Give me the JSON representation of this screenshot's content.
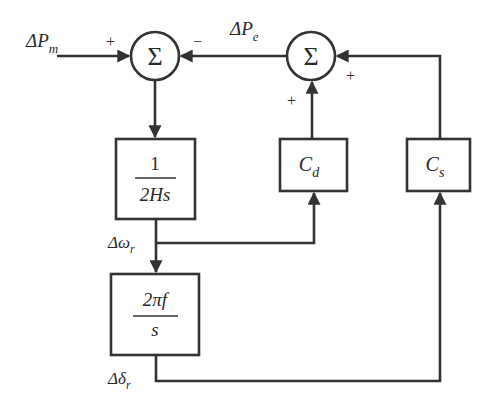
{
  "diagram": {
    "type": "block-diagram",
    "title": "",
    "colors": {
      "line": "#333333",
      "text": "#2a2a2a",
      "background": "#ffffff"
    },
    "nodes": [
      {
        "id": "sum1",
        "kind": "summing-junction",
        "symbol": "Σ"
      },
      {
        "id": "sum2",
        "kind": "summing-junction",
        "symbol": "Σ"
      },
      {
        "id": "inertia",
        "kind": "block",
        "numerator": "1",
        "denominator": "2Hs"
      },
      {
        "id": "integrator",
        "kind": "block",
        "numerator": "2πf",
        "denominator": "s"
      },
      {
        "id": "damping",
        "kind": "block",
        "label": "C",
        "subscript": "d"
      },
      {
        "id": "synchronizing",
        "kind": "block",
        "label": "C",
        "subscript": "s"
      }
    ],
    "signals": {
      "input": {
        "base": "ΔP",
        "sub": "m"
      },
      "electrical": {
        "base": "ΔP",
        "sub": "e"
      },
      "speed": {
        "base": "Δω",
        "sub": "r"
      },
      "angle": {
        "base": "Δδ",
        "sub": "r"
      }
    },
    "signs": {
      "sum1_input": "+",
      "sum1_feedback": "−",
      "sum2_from_damping": "+",
      "sum2_from_sync": "+"
    },
    "edges": [
      {
        "from": "input",
        "to": "sum1",
        "sign": "+"
      },
      {
        "from": "sum2",
        "to": "sum1",
        "sign": "−",
        "label": "ΔPe"
      },
      {
        "from": "sum1",
        "to": "inertia"
      },
      {
        "from": "inertia",
        "to": "integrator",
        "label": "Δωr"
      },
      {
        "from": "inertia",
        "to": "damping",
        "label": "Δωr"
      },
      {
        "from": "integrator",
        "to": "synchronizing",
        "label": "Δδr"
      },
      {
        "from": "damping",
        "to": "sum2",
        "sign": "+"
      },
      {
        "from": "synchronizing",
        "to": "sum2",
        "sign": "+"
      }
    ]
  }
}
